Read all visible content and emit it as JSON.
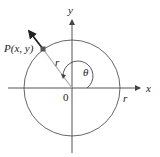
{
  "diagram": {
    "type": "unit-circle-angle",
    "labels": {
      "point": "P(x, y)",
      "radius_inner": "r",
      "radius_axis": "r",
      "angle": "θ",
      "origin": "0",
      "x_axis": "x",
      "y_axis": "y"
    },
    "colors": {
      "axes": "#555555",
      "circle": "#666666",
      "radius_line": "#aaaaaa",
      "arrow": "#222222",
      "point": "#555555",
      "text": "#222222"
    }
  }
}
